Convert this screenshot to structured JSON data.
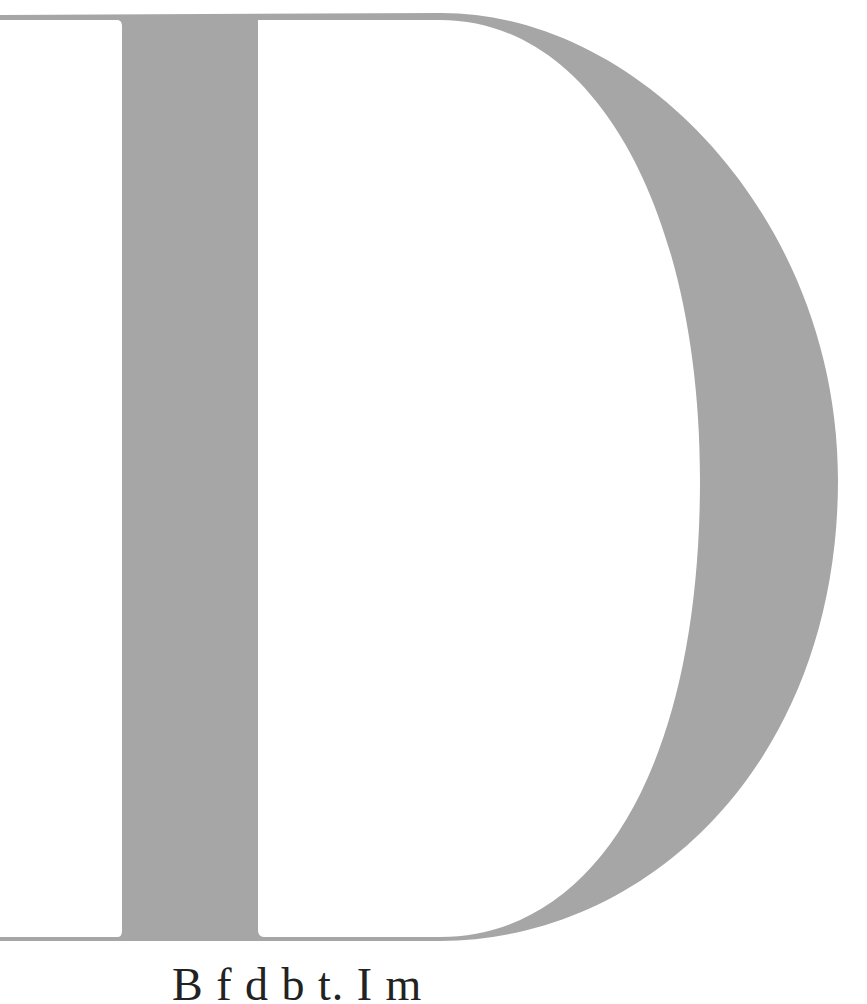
{
  "page": {
    "drop_cap": {
      "letter": "D",
      "color": "#a6a6a6"
    },
    "caption": {
      "text": "B       f                     d  b  t.  I  m"
    }
  }
}
